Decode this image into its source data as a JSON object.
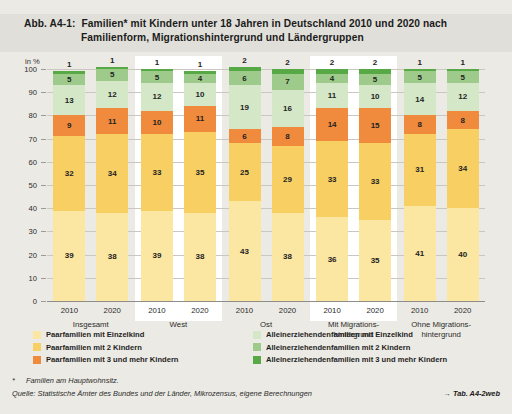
{
  "figure": {
    "number": "Abb. A4-1:",
    "title_line1": "Familien* mit Kindern unter 18 Jahren in Deutschland 2010 und 2020 nach",
    "title_line2": "Familienform, Migrationshintergrund und Ländergruppen",
    "unit": "in %"
  },
  "footnotes": {
    "star_mark": "*",
    "star_text": "Familien am Hauptwohnsitz.",
    "source": "Quelle: Statistische Ämter des Bundes und der Länder, Mikrozensus, eigene Berechnungen",
    "reference": "→ Tab. A4-2web"
  },
  "legend": {
    "left": [
      {
        "label": "Paarfamilien mit Einzelkind",
        "color": "#fbe6a2"
      },
      {
        "label": "Paarfamilien mit 2 Kindern",
        "color": "#f8cf63"
      },
      {
        "label": "Paarfamilien mit 3 und mehr Kindern",
        "color": "#f08a3c"
      }
    ],
    "right": [
      {
        "label": "Alleinerziehendenfamilien mit Einzelkind",
        "color": "#d4e8c8"
      },
      {
        "label": "Alleinerziehendenfamilien mit 2 Kindern",
        "color": "#9ecb8c"
      },
      {
        "label": "Alleinerziehendenfamilien mit 3 und mehr Kindern",
        "color": "#57a946"
      }
    ]
  },
  "chart_data": {
    "type": "bar",
    "stacked": true,
    "title": "Familien* mit Kindern unter 18 Jahren in Deutschland 2010 und 2020 nach Familienform, Migrationshintergrund und Ländergruppen",
    "xlabel": "",
    "ylabel": "in %",
    "ylim": [
      0,
      100
    ],
    "yticks": [
      0,
      10,
      20,
      30,
      40,
      50,
      60,
      70,
      80,
      90,
      100
    ],
    "grid": true,
    "legend_position": "bottom",
    "groups": [
      {
        "name": "Insgesamt",
        "panel": "grey"
      },
      {
        "name": "West",
        "panel": "white"
      },
      {
        "name": "Ost",
        "panel": "grey"
      },
      {
        "name": "Mit Migrations-\nhintergrund",
        "panel": "white"
      },
      {
        "name": "Ohne Migrations-\nhintergrund",
        "panel": "grey"
      }
    ],
    "group_labels": [
      "Insgesamt",
      "West",
      "Ost",
      "Mit Migrations-|hintergrund",
      "Ohne Migrations-|hintergrund"
    ],
    "categories": [
      "Insgesamt 2010",
      "Insgesamt 2020",
      "West 2010",
      "West 2020",
      "Ost 2010",
      "Ost 2020",
      "Mit Migrationshintergrund 2010",
      "Mit Migrationshintergrund 2020",
      "Ohne Migrationshintergrund 2010",
      "Ohne Migrationshintergrund 2020"
    ],
    "years": [
      "2010",
      "2020",
      "2010",
      "2020",
      "2010",
      "2020",
      "2010",
      "2020",
      "2010",
      "2020"
    ],
    "series": [
      {
        "name": "Paarfamilien mit Einzelkind",
        "color": "#fbe6a2",
        "values": [
          39,
          38,
          39,
          38,
          43,
          38,
          36,
          35,
          41,
          40
        ]
      },
      {
        "name": "Paarfamilien mit 2 Kindern",
        "color": "#f8cf63",
        "values": [
          32,
          34,
          33,
          35,
          25,
          29,
          33,
          33,
          31,
          34
        ]
      },
      {
        "name": "Paarfamilien mit 3 und mehr Kindern",
        "color": "#f08a3c",
        "values": [
          9,
          11,
          10,
          11,
          6,
          8,
          14,
          15,
          8,
          8
        ]
      },
      {
        "name": "Alleinerziehendenfamilien mit Einzelkind",
        "color": "#d4e8c8",
        "values": [
          13,
          12,
          12,
          10,
          19,
          16,
          11,
          10,
          14,
          12
        ]
      },
      {
        "name": "Alleinerziehendenfamilien mit 2 Kindern",
        "color": "#9ecb8c",
        "values": [
          5,
          5,
          5,
          4,
          6,
          7,
          4,
          5,
          5,
          5
        ]
      },
      {
        "name": "Alleinerziehendenfamilien mit 3 und mehr Kindern",
        "color": "#57a946",
        "values": [
          1,
          1,
          1,
          1,
          2,
          2,
          2,
          2,
          1,
          1
        ]
      }
    ],
    "top_labels": [
      1,
      1,
      1,
      1,
      2,
      2,
      2,
      2,
      1,
      1
    ]
  }
}
